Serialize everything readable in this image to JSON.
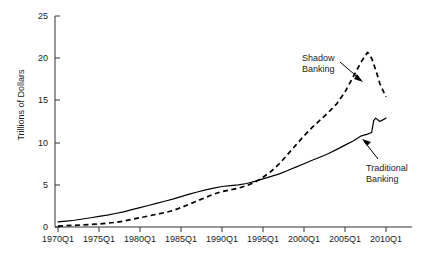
{
  "chart_data": {
    "type": "line",
    "title": "",
    "xlabel": "",
    "ylabel": "Trillions of Dollars",
    "ylim": [
      0,
      25
    ],
    "yticks": [
      0,
      5,
      10,
      15,
      20,
      25
    ],
    "xticks": [
      "1970Q1",
      "1975Q1",
      "1980Q1",
      "1985Q1",
      "1990Q1",
      "1995Q1",
      "2000Q1",
      "2005Q1",
      "2010Q1"
    ],
    "grid": false,
    "legend": "annotations",
    "annotations": [
      {
        "text_line1": "Shadow",
        "text_line2": "Banking",
        "target_series": "Shadow Banking"
      },
      {
        "text_line1": "Traditional",
        "text_line2": "Banking",
        "target_series": "Traditional Banking"
      }
    ],
    "series": [
      {
        "name": "Shadow Banking",
        "style": "dashed",
        "color": "#000000",
        "x": [
          "1970Q1",
          "1971Q1",
          "1972Q1",
          "1973Q1",
          "1974Q1",
          "1975Q1",
          "1976Q1",
          "1977Q1",
          "1978Q1",
          "1979Q1",
          "1980Q1",
          "1981Q1",
          "1982Q1",
          "1983Q1",
          "1984Q1",
          "1985Q1",
          "1986Q1",
          "1987Q1",
          "1988Q1",
          "1989Q1",
          "1990Q1",
          "1991Q1",
          "1992Q1",
          "1993Q1",
          "1994Q1",
          "1995Q1",
          "1996Q1",
          "1997Q1",
          "1998Q1",
          "1999Q1",
          "2000Q1",
          "2001Q1",
          "2002Q1",
          "2003Q1",
          "2004Q1",
          "2005Q1",
          "2006Q1",
          "2007Q1",
          "2007Q4",
          "2008Q2",
          "2008Q4",
          "2009Q2",
          "2010Q1"
        ],
        "values": [
          0.1,
          0.15,
          0.2,
          0.25,
          0.3,
          0.35,
          0.45,
          0.55,
          0.7,
          0.9,
          1.1,
          1.3,
          1.5,
          1.7,
          1.95,
          2.3,
          2.7,
          3.1,
          3.5,
          3.9,
          4.2,
          4.4,
          4.6,
          4.9,
          5.3,
          5.9,
          6.6,
          7.5,
          8.6,
          9.7,
          10.8,
          11.8,
          12.7,
          13.6,
          14.6,
          16.0,
          17.8,
          19.6,
          20.7,
          20.0,
          18.6,
          17.0,
          15.4
        ]
      },
      {
        "name": "Traditional Banking",
        "style": "solid",
        "color": "#000000",
        "x": [
          "1970Q1",
          "1971Q1",
          "1972Q1",
          "1973Q1",
          "1974Q1",
          "1975Q1",
          "1976Q1",
          "1977Q1",
          "1978Q1",
          "1979Q1",
          "1980Q1",
          "1981Q1",
          "1982Q1",
          "1983Q1",
          "1984Q1",
          "1985Q1",
          "1986Q1",
          "1987Q1",
          "1988Q1",
          "1989Q1",
          "1990Q1",
          "1991Q1",
          "1992Q1",
          "1993Q1",
          "1994Q1",
          "1995Q1",
          "1996Q1",
          "1997Q1",
          "1998Q1",
          "1999Q1",
          "2000Q1",
          "2001Q1",
          "2002Q1",
          "2003Q1",
          "2004Q1",
          "2005Q1",
          "2006Q1",
          "2007Q1",
          "2007Q4",
          "2008Q2",
          "2008Q3",
          "2008Q4",
          "2009Q2",
          "2010Q1"
        ],
        "values": [
          0.6,
          0.7,
          0.8,
          0.95,
          1.1,
          1.25,
          1.4,
          1.6,
          1.8,
          2.05,
          2.3,
          2.55,
          2.8,
          3.05,
          3.3,
          3.6,
          3.9,
          4.15,
          4.4,
          4.6,
          4.8,
          4.9,
          5.0,
          5.15,
          5.4,
          5.7,
          6.0,
          6.3,
          6.7,
          7.1,
          7.5,
          7.9,
          8.3,
          8.7,
          9.2,
          9.7,
          10.2,
          10.8,
          11.0,
          11.2,
          12.6,
          12.9,
          12.5,
          12.9
        ]
      }
    ]
  },
  "axis": {
    "y_label": "Trillions of Dollars",
    "y_tick_labels": [
      "25",
      "20",
      "15",
      "10",
      "5",
      "0"
    ],
    "x_tick_labels": [
      "1970Q1",
      "1975Q1",
      "1980Q1",
      "1985Q1",
      "1990Q1",
      "1995Q1",
      "2000Q1",
      "2005Q1",
      "2010Q1"
    ]
  },
  "annotations": {
    "shadow": {
      "line1": "Shadow",
      "line2": "Banking"
    },
    "traditional": {
      "line1": "Traditional",
      "line2": "Banking"
    }
  }
}
